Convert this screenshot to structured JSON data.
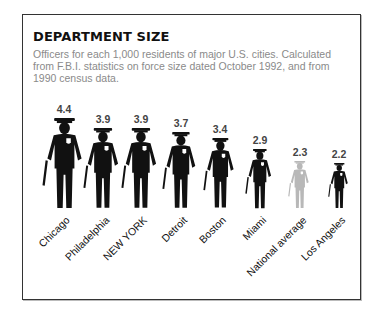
{
  "title": "DEPARTMENT SIZE",
  "subtitle": "Officers for each 1,000 residents of major U.S. cities. Calculated from F.B.I. statistics on force size dated October 1992, and  from 1990 census data.",
  "colors": {
    "figure": "#111111",
    "national_average": "#b8b8b8",
    "subtitle": "#8a8a8a"
  },
  "chart_data": {
    "type": "bar",
    "style": "pictogram (police officer figures sized by value)",
    "title": "DEPARTMENT SIZE",
    "subtitle": "Officers for each 1,000 residents of major U.S. cities. Calculated from F.B.I. statistics on force size dated October 1992, and  from 1990 census data.",
    "categories": [
      "Chicago",
      "Philadelphia",
      "NEW YORK",
      "Detroit",
      "Boston",
      "Miami",
      "National average",
      "Los Angeles"
    ],
    "values": [
      4.4,
      3.9,
      3.9,
      3.7,
      3.4,
      2.9,
      2.3,
      2.2
    ],
    "value_labels": [
      "4.4",
      "3.9",
      "3.9",
      "3.7",
      "3.4",
      "2.9",
      "2.3",
      "2.2"
    ],
    "highlight": {
      "National average": "gray"
    },
    "xlabel": "",
    "ylabel": "Officers per 1,000 residents",
    "grid": false,
    "legend": null
  }
}
